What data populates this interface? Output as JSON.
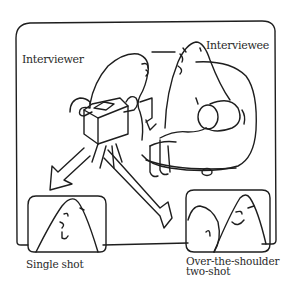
{
  "labels": {
    "interviewer": "Interviewer",
    "interviewee": "Interviewee",
    "single_shot": "Single shot",
    "over_shoulder_line1": "Over-the-shoulder",
    "over_shoulder_line2": "two-shot"
  },
  "colors": {
    "ink": "#1e1e1e",
    "background": "#ffffff"
  }
}
